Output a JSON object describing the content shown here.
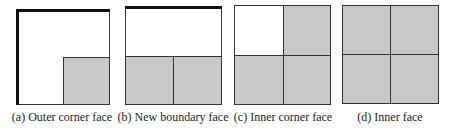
{
  "panels": [
    {
      "id": "a",
      "caption": "(a) Outer corner face",
      "thick_edges": [
        "top",
        "left"
      ],
      "shaded_cells": [
        "bottom-right"
      ]
    },
    {
      "id": "b",
      "caption": "(b) New boundary face",
      "thick_edges": [
        "top"
      ],
      "shaded_cells": [
        "bottom-left",
        "bottom-right"
      ]
    },
    {
      "id": "c",
      "caption": "(c) Inner corner face",
      "thick_edges": [],
      "shaded_cells": [
        "top-right",
        "bottom-left",
        "bottom-right"
      ]
    },
    {
      "id": "d",
      "caption": "(d) Inner face",
      "thick_edges": [],
      "shaded_cells": [
        "top-left",
        "top-right",
        "bottom-left",
        "bottom-right"
      ]
    }
  ],
  "colors": {
    "shade": "#c8c8c8",
    "line": "#333333",
    "thick_line": "#111111"
  }
}
